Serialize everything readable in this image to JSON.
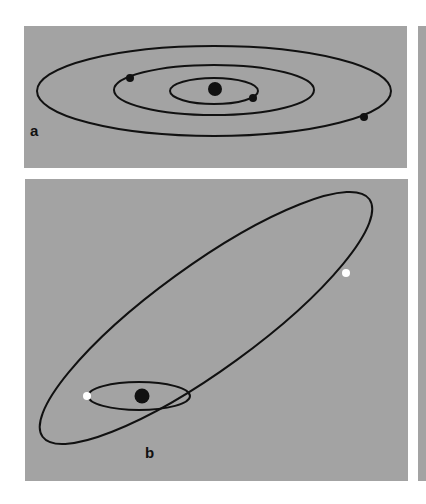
{
  "figure": {
    "background_color": "#ffffff",
    "panel_color": "#a3a3a3",
    "orbit_color": "#111111",
    "panels": [
      {
        "id": "a",
        "label": "a",
        "description": "Concentric elliptical orbits around a central star with dark planets",
        "central_body": {
          "color": "#111111"
        },
        "orbits": [
          {
            "name": "inner-orbit",
            "planet_color": "#111111"
          },
          {
            "name": "middle-orbit",
            "planet_color": "#111111"
          },
          {
            "name": "outer-orbit",
            "planet_color": "#111111"
          }
        ]
      },
      {
        "id": "b",
        "label": "b",
        "description": "Small orbit around central star with a highly eccentric tilted orbit; white bodies",
        "central_body": {
          "color": "#111111"
        },
        "orbits": [
          {
            "name": "small-orbit",
            "planet_color": "#ffffff"
          },
          {
            "name": "eccentric-orbit",
            "planet_color": "#ffffff"
          }
        ]
      },
      {
        "id": "c",
        "label": "",
        "description": "Partially visible third panel (cropped)"
      }
    ]
  }
}
